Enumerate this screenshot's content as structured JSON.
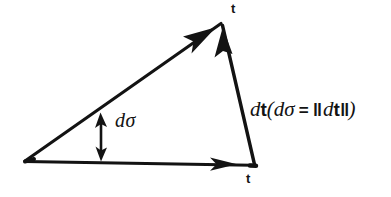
{
  "figure": {
    "background_color": "#ffffff",
    "ink_color": "#131313",
    "labels": {
      "t_top": "t",
      "t_bottom": "t",
      "d_sigma": "dσ",
      "expression": {
        "full": "dt(dσ = ‖dt‖)",
        "lead_d": "d",
        "lead_t": "t",
        "open_paren": "(",
        "inner_d": "d",
        "inner_sigma": "σ",
        "equals": "=",
        "norm_open": "‖",
        "norm_d": "d",
        "norm_t": "t",
        "norm_close": "‖",
        "close_paren": ")"
      }
    },
    "geometry": {
      "vertices": {
        "left": [
          25,
          162
        ],
        "top": [
          222,
          23
        ],
        "right": [
          255,
          165
        ]
      },
      "edges": [
        {
          "name": "base-vector-t",
          "from": [
            25,
            162
          ],
          "to": [
            255,
            165
          ],
          "arrowhead_at": [
            228,
            164
          ]
        },
        {
          "name": "hypotenuse-vector-t",
          "from": [
            25,
            162
          ],
          "to": [
            222,
            23
          ],
          "arrowhead_at": [
            208,
            33
          ]
        },
        {
          "name": "right-vector-dt",
          "from": [
            255,
            165
          ],
          "to": [
            222,
            23
          ],
          "arrowhead_at": [
            225,
            34
          ]
        }
      ],
      "angle_marker": {
        "name": "d-sigma-double-arrow",
        "x": 101,
        "y_top": 113,
        "y_bottom": 161
      }
    }
  }
}
